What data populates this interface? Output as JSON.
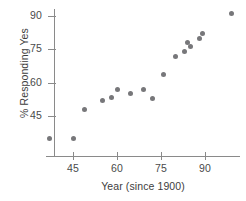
{
  "chart_data": {
    "type": "scatter",
    "title": "",
    "xlabel": "Year (since 1900)",
    "ylabel": "% Responding Yes",
    "xlim": [
      33,
      103
    ],
    "ylim": [
      30,
      96
    ],
    "grid": false,
    "legend": null,
    "xticks": [
      45,
      60,
      75,
      90
    ],
    "xtick_labels": [
      "45",
      "60",
      "75",
      "90"
    ],
    "yticks": [
      45,
      60,
      75,
      90
    ],
    "ytick_labels": [
      "45",
      "60",
      "75",
      "90"
    ],
    "marker_color": "#77777a",
    "axis_color": "#8a8a8a",
    "points": [
      {
        "x": 37,
        "y": 35
      },
      {
        "x": 45,
        "y": 35
      },
      {
        "x": 49,
        "y": 48
      },
      {
        "x": 55,
        "y": 52
      },
      {
        "x": 58,
        "y": 53.5
      },
      {
        "x": 60,
        "y": 57
      },
      {
        "x": 64.5,
        "y": 55
      },
      {
        "x": 69,
        "y": 57
      },
      {
        "x": 72,
        "y": 53
      },
      {
        "x": 76,
        "y": 63.5
      },
      {
        "x": 80,
        "y": 72
      },
      {
        "x": 83,
        "y": 74
      },
      {
        "x": 84,
        "y": 78
      },
      {
        "x": 85,
        "y": 76.5
      },
      {
        "x": 88,
        "y": 80
      },
      {
        "x": 89,
        "y": 82
      },
      {
        "x": 99,
        "y": 91
      }
    ]
  }
}
